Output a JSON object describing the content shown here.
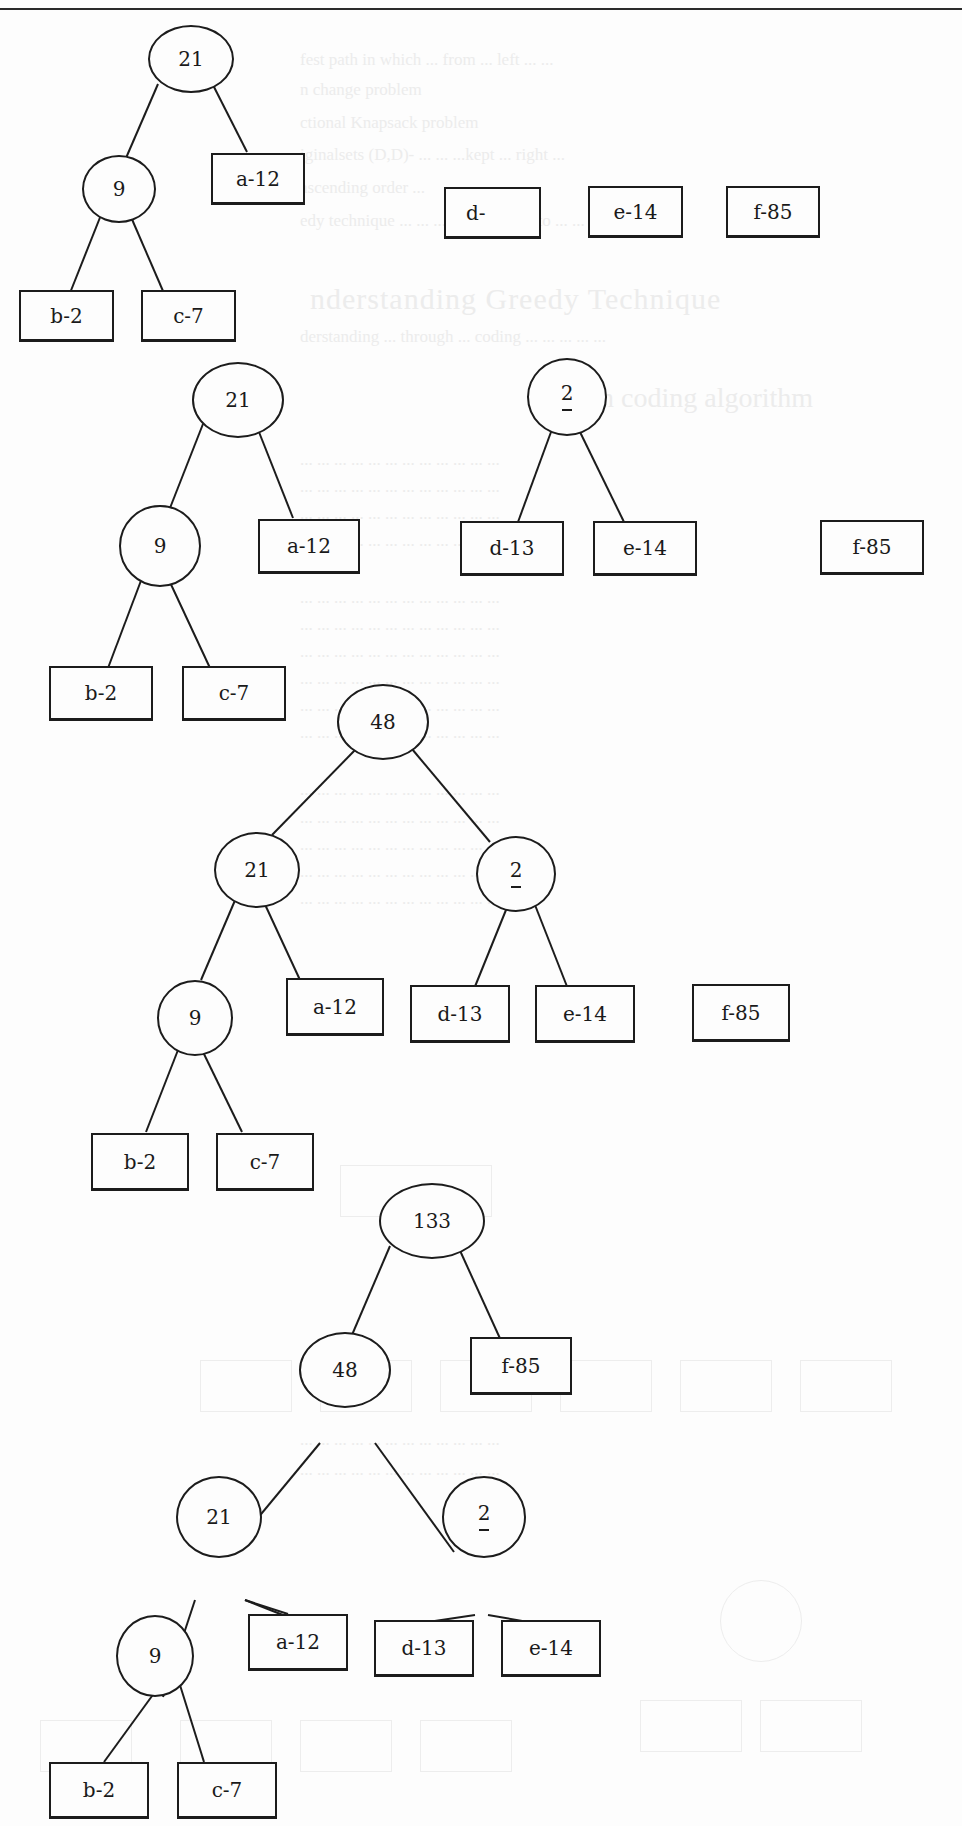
{
  "page": {
    "type": "scanned-textbook-page",
    "background_bleed_text": [
      "...fest path in which ... from ... left ...",
      "...n change ...",
      "...ctional Knapsack problem",
      "...iginalsets (D,D)-... ...kept ... right ...",
      "...ascending ... ",
      "...edy technique ... ... ... algorithm ... ...",
      "nderstanding Greedy Technique",
      "...derstanding ... through ... coding ... ... ...",
      "...n coding algorithm"
    ]
  },
  "diagram": {
    "steps": [
      {
        "id": "step1",
        "trees": [
          {
            "root": {
              "label": "21",
              "type": "internal"
            },
            "children": [
              {
                "label": "9",
                "type": "internal",
                "children": [
                  {
                    "label": "b-2",
                    "type": "leaf"
                  },
                  {
                    "label": "c-7",
                    "type": "leaf"
                  }
                ]
              },
              {
                "label": "a-12",
                "type": "leaf"
              }
            ]
          }
        ],
        "standalone_leaves": [
          {
            "label": "d-",
            "type": "leaf"
          },
          {
            "label": "e-14",
            "type": "leaf"
          },
          {
            "label": "f-85",
            "type": "leaf"
          }
        ]
      },
      {
        "id": "step2",
        "trees": [
          {
            "root": {
              "label": "21",
              "type": "internal"
            },
            "children": [
              {
                "label": "9",
                "type": "internal",
                "children": [
                  {
                    "label": "b-2",
                    "type": "leaf"
                  },
                  {
                    "label": "c-7",
                    "type": "leaf"
                  }
                ]
              },
              {
                "label": "a-12",
                "type": "leaf"
              }
            ]
          },
          {
            "root": {
              "label": "2",
              "sublabel": "_",
              "type": "internal"
            },
            "children": [
              {
                "label": "d-13",
                "type": "leaf"
              },
              {
                "label": "e-14",
                "type": "leaf"
              }
            ]
          }
        ],
        "standalone_leaves": [
          {
            "label": "f-85",
            "type": "leaf"
          }
        ]
      },
      {
        "id": "step3",
        "trees": [
          {
            "root": {
              "label": "48",
              "type": "internal"
            },
            "children": [
              {
                "label": "21",
                "type": "internal",
                "children": [
                  {
                    "label": "9",
                    "type": "internal",
                    "children": [
                      {
                        "label": "b-2",
                        "type": "leaf"
                      },
                      {
                        "label": "c-7",
                        "type": "leaf"
                      }
                    ]
                  },
                  {
                    "label": "a-12",
                    "type": "leaf"
                  }
                ]
              },
              {
                "label": "2",
                "sublabel": "_",
                "type": "internal",
                "children": [
                  {
                    "label": "d-13",
                    "type": "leaf"
                  },
                  {
                    "label": "e-14",
                    "type": "leaf"
                  }
                ]
              }
            ]
          }
        ],
        "standalone_leaves": [
          {
            "label": "f-85",
            "type": "leaf"
          }
        ]
      },
      {
        "id": "step4",
        "trees": [
          {
            "root": {
              "label": "133",
              "type": "internal"
            },
            "children": [
              {
                "label": "48",
                "type": "internal",
                "children": [
                  {
                    "label": "21",
                    "type": "internal",
                    "children": [
                      {
                        "label": "9",
                        "type": "internal",
                        "children": [
                          {
                            "label": "b-2",
                            "type": "leaf"
                          },
                          {
                            "label": "c-7",
                            "type": "leaf"
                          }
                        ]
                      },
                      {
                        "label": "a-12",
                        "type": "leaf"
                      }
                    ]
                  },
                  {
                    "label": "2",
                    "sublabel": "_",
                    "type": "internal",
                    "children": [
                      {
                        "label": "d-13",
                        "type": "leaf"
                      },
                      {
                        "label": "e-14",
                        "type": "leaf"
                      }
                    ]
                  }
                ]
              },
              {
                "label": "f-85",
                "type": "leaf"
              }
            ]
          }
        ],
        "standalone_leaves": []
      }
    ]
  },
  "labels": {
    "s1": {
      "n21": "21",
      "n9": "9",
      "a": "a-12",
      "b": "b-2",
      "c": "c-7",
      "d": "d-",
      "e": "e-14",
      "f": "f-85"
    },
    "s2": {
      "n21": "21",
      "n9": "9",
      "n27": "2",
      "a": "a-12",
      "b": "b-2",
      "c": "c-7",
      "d": "d-13",
      "e": "e-14",
      "f": "f-85"
    },
    "s3": {
      "n48": "48",
      "n21": "21",
      "n9": "9",
      "n27": "2",
      "a": "a-12",
      "b": "b-2",
      "c": "c-7",
      "d": "d-13",
      "e": "e-14",
      "f": "f-85"
    },
    "s4": {
      "n133": "133",
      "n48": "48",
      "n21": "21",
      "n9": "9",
      "n27": "2",
      "a": "a-12",
      "b": "b-2",
      "c": "c-7",
      "d": "d-13",
      "e": "e-14",
      "f": "f-85"
    }
  },
  "ghost": {
    "l1": "fest path in which ... from ... left ... ...",
    "l2": "n change problem",
    "l3": "ctional Knapsack problem",
    "l4": "iginalsets (D,D)- ... ... ...kept ... right ...",
    "l5": "ascending order ...",
    "l6": "edy technique ... ... ... ... algorithm to ... ...",
    "h1": "nderstanding Greedy Technique",
    "l7": "derstanding ... through ... coding ... ... ... ... ...",
    "h2": "n coding algorithm",
    "p1": "... ... ... ... ... ... ... ... ... ... ... ...",
    "p2": "... ... ... ... ... ... ... ... ... ... ... ...",
    "p3": "... ... ... ... ... ... ... ... ... ... ... ...",
    "p4": "... ... ... ... ... ... ... ... ... ... ... ...",
    "p5": "... ... ... ... ... ... ... ... ... ... ... ...",
    "p6": "... ... ... ... ... ... ... ... ... ... ... ...",
    "p7": "... ... ... ... ... ... ... ... ... ... ... ...",
    "p8": "... ... ... ... ... ... ... ... ... ... ... ...",
    "p9": "... ... ... ... ... ... ... ... ... ... ... ...",
    "p10": "... ... ... ... ... ... ... ... ... ... ... ...",
    "p11": "... ... ... ... ... ... ... ... ... ... ... ...",
    "p12": "... ... ... ... ... ... ... ... ... ... ... ...",
    "p13": "... ... ... ... ... ... ... ... ... ... ... ...",
    "p14": "... ... ... ... ... ... ... ... ... ... ... ...",
    "p15": "... ... ... ... ... ... ... ... ... ... ... ...",
    "p16": "... ... ... ... ... ... ... ... ... ... ... ...",
    "p17": "... ... ... ... ... ... ... ... ... ... ... ..."
  }
}
